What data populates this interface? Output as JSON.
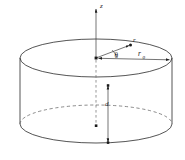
{
  "figure": {
    "type": "technical-line-diagram",
    "background_color": "#ffffff",
    "line_color": "#2a2a2a",
    "labels": {
      "axis_z": "z",
      "radial_vector": "r",
      "angle_theta": "θ",
      "outer_radius": "r",
      "outer_radius_subscript": "0",
      "depth": "d"
    },
    "geometry": {
      "top_ellipse": {
        "center_x": 96,
        "center_y": 58,
        "radius_x": 76,
        "radius_y": 19
      },
      "bottom_ellipse": {
        "center_x": 96,
        "center_y": 124,
        "radius_x": 76,
        "radius_y": 19
      },
      "origin": {
        "x": 96,
        "y": 58
      },
      "z_axis_top": {
        "x": 96,
        "y": 6
      },
      "r_vector_tip": {
        "x": 131,
        "y": 45
      },
      "r0_arrow_end": {
        "x": 170,
        "y": 60
      },
      "depth_line_x": 108,
      "depth_top_y": 85,
      "depth_bottom_y": 143
    }
  }
}
